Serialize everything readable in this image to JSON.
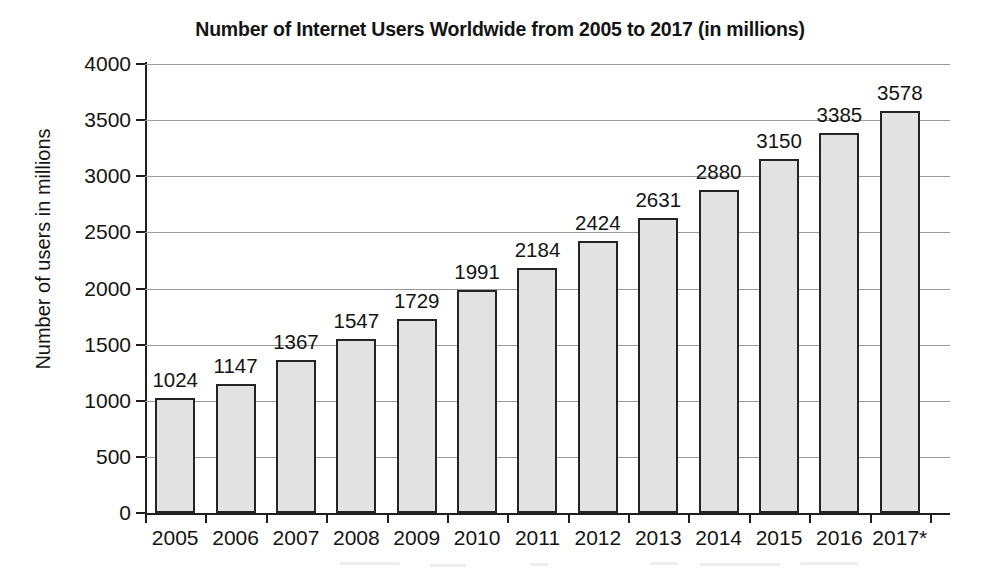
{
  "chart_data": {
    "type": "bar",
    "title": "Number of Internet Users Worldwide from 2005 to 2017 (in millions)",
    "xlabel": "",
    "ylabel": "Number of users in millions",
    "categories": [
      "2005",
      "2006",
      "2007",
      "2008",
      "2009",
      "2010",
      "2011",
      "2012",
      "2013",
      "2014",
      "2015",
      "2016",
      "2017*"
    ],
    "values": [
      1024,
      1147,
      1367,
      1547,
      1729,
      1991,
      2184,
      2424,
      2631,
      2880,
      3150,
      3385,
      3578
    ],
    "ylim": [
      0,
      4000
    ],
    "yticks": [
      0,
      500,
      1000,
      1500,
      2000,
      2500,
      3000,
      3500,
      4000
    ],
    "ytick_labels": [
      "0",
      "500",
      "1000",
      "1500",
      "2000",
      "2500",
      "3000",
      "3500",
      "4000"
    ],
    "data_labels": [
      "1024",
      "1147",
      "1367",
      "1547",
      "1729",
      "1991",
      "2184",
      "2424",
      "2631",
      "2880",
      "3150",
      "3385",
      "3578"
    ],
    "grid": "horizontal",
    "legend": "none",
    "bar_fill_color": "#e2e2e2",
    "bar_edge_color": "#242424",
    "gridline_color": "#9a9a9a",
    "axis_color": "#1f1f1f",
    "text_color": "#141414",
    "background_color": "#ffffff",
    "footnote_marker": "*"
  }
}
